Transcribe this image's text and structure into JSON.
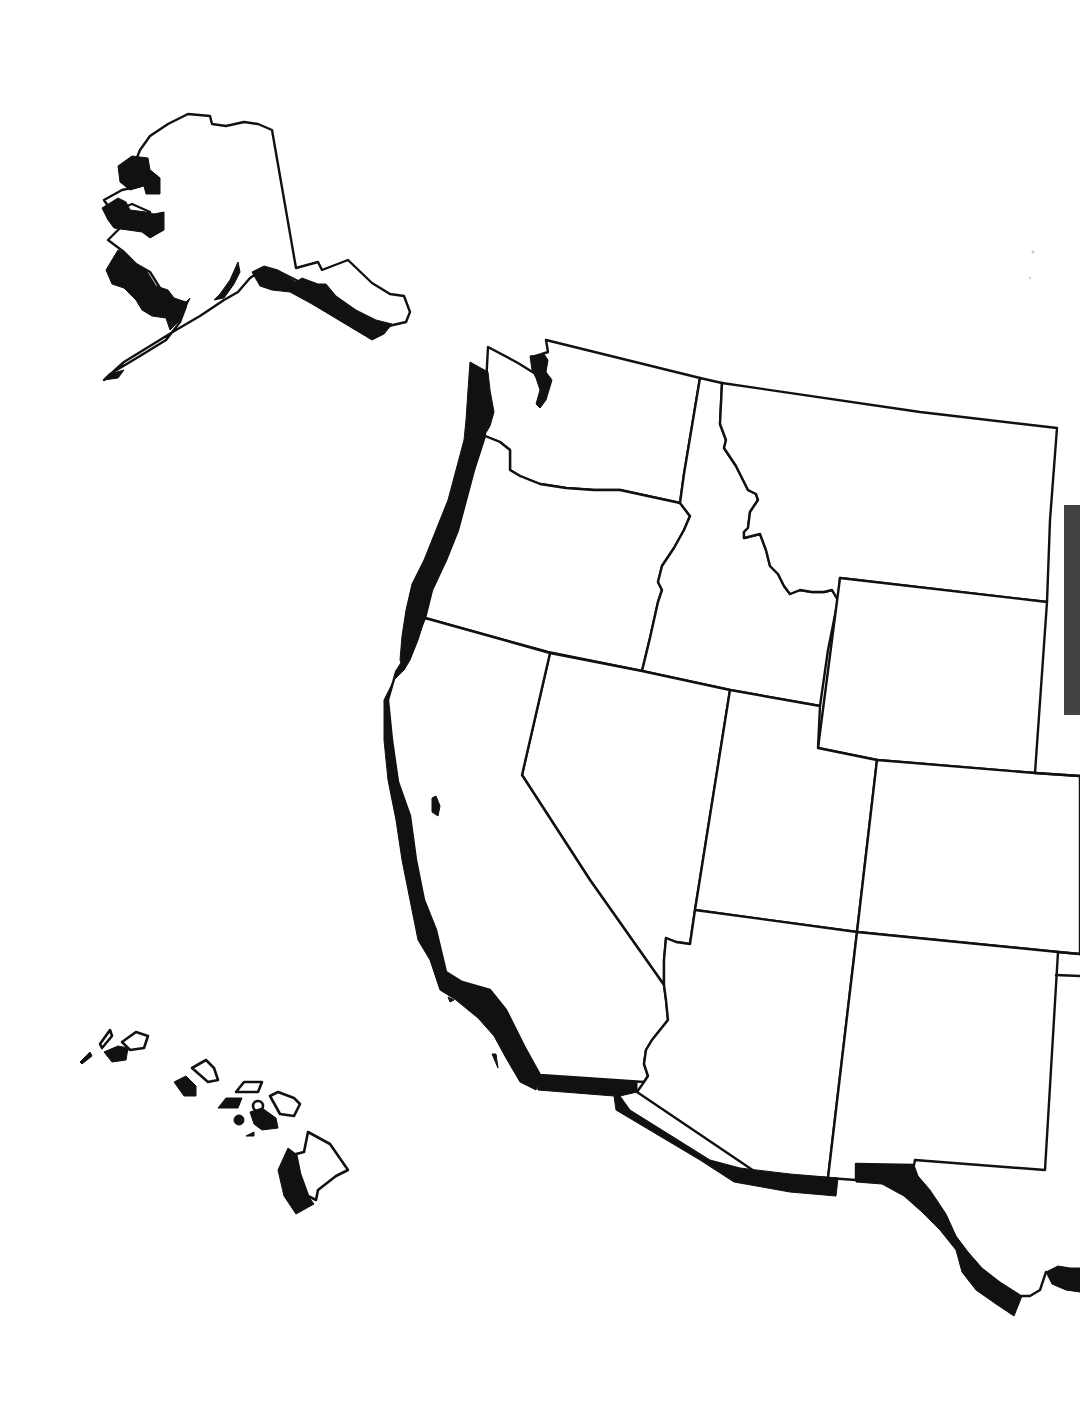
{
  "map": {
    "type": "blank outline map",
    "region": "Western United States",
    "has_text_labels": false,
    "fill_color": "#ffffff",
    "border_color": "#111111",
    "coastal_zone_color": "#111111",
    "regions": [
      {
        "id": "alaska",
        "name": "Alaska"
      },
      {
        "id": "hawaii",
        "name": "Hawaii"
      },
      {
        "id": "washington",
        "name": "Washington"
      },
      {
        "id": "oregon",
        "name": "Oregon"
      },
      {
        "id": "california",
        "name": "California"
      },
      {
        "id": "idaho",
        "name": "Idaho"
      },
      {
        "id": "nevada",
        "name": "Nevada"
      },
      {
        "id": "montana",
        "name": "Montana"
      },
      {
        "id": "wyoming",
        "name": "Wyoming"
      },
      {
        "id": "utah",
        "name": "Utah"
      },
      {
        "id": "colorado",
        "name": "Colorado"
      },
      {
        "id": "arizona",
        "name": "Arizona"
      },
      {
        "id": "new-mexico",
        "name": "New Mexico"
      }
    ],
    "coastal_shading": [
      "Alaska western and southern coast",
      "Pacific coast (Washington, Oregon, California)",
      "Puget Sound",
      "US–Mexico border (California, Arizona, New Mexico)",
      "Rio Grande (Texas border)",
      "Hawaii island western sides"
    ]
  }
}
